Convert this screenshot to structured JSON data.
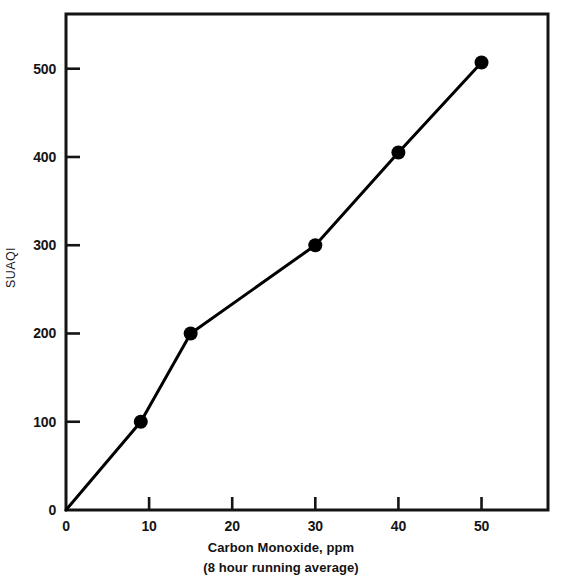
{
  "chart_data": {
    "type": "line",
    "title": "",
    "xlabel": "Carbon Monoxide, ppm",
    "xlabel_sub": "(8 hour running average)",
    "ylabel": "SUAQI",
    "xlim": [
      0,
      58
    ],
    "ylim": [
      0,
      562
    ],
    "grid": false,
    "legend": "none",
    "xticks": [
      0,
      10,
      20,
      30,
      40,
      50
    ],
    "xtick_labels": [
      "0",
      "10",
      "20",
      "30",
      "40",
      "50"
    ],
    "yticks": [
      0,
      100,
      200,
      300,
      400,
      500
    ],
    "ytick_labels": [
      "0",
      "100",
      "200",
      "300",
      "400",
      "500"
    ],
    "series": [
      {
        "name": "SUAQI vs Carbon Monoxide",
        "color": "#000000",
        "marker": "filled-circle",
        "x": [
          0,
          9,
          15,
          30,
          40,
          50
        ],
        "y": [
          0,
          100,
          200,
          300,
          405,
          507
        ],
        "marker_at": [
          false,
          true,
          true,
          true,
          true,
          true
        ]
      }
    ]
  },
  "axis": {
    "y_title": "SUAQI",
    "x_title_line1": "Carbon Monoxide, ppm",
    "x_title_line2": "(8 hour running average)"
  },
  "style": {
    "line_color": "#000000",
    "frame_color": "#141414",
    "background": "#ffffff"
  }
}
